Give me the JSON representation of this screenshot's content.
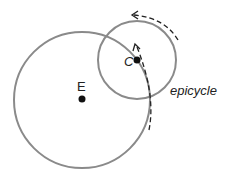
{
  "diagram": {
    "labels": {
      "earth": "E",
      "center": "C",
      "epicycle": "epicycle"
    },
    "colors": {
      "circle": "#8a8a8a",
      "dot": "#111111",
      "arrow": "#222222"
    }
  }
}
